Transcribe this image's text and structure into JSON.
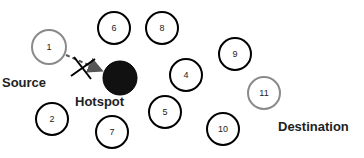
{
  "diagram": {
    "labels": {
      "source": "Source",
      "hotspot": "Hotspot",
      "destination": "Destination"
    },
    "colors": {
      "normal_stroke": "#000000",
      "endpoint_stroke": "#8a8a8a",
      "hotspot_fill": "#111111",
      "arrow": "#555555"
    },
    "nodes": [
      {
        "id": "1",
        "label": "1",
        "x": 49,
        "y": 47,
        "r": 18,
        "type": "source"
      },
      {
        "id": "2",
        "label": "2",
        "x": 52,
        "y": 119,
        "r": 16,
        "type": "normal"
      },
      {
        "id": "4",
        "label": "4",
        "x": 186,
        "y": 75,
        "r": 16,
        "type": "normal"
      },
      {
        "id": "5",
        "label": "5",
        "x": 165,
        "y": 112,
        "r": 16,
        "type": "normal"
      },
      {
        "id": "6",
        "label": "6",
        "x": 114,
        "y": 28,
        "r": 16,
        "type": "normal"
      },
      {
        "id": "7",
        "label": "7",
        "x": 112,
        "y": 132,
        "r": 16,
        "type": "normal"
      },
      {
        "id": "8",
        "label": "8",
        "x": 162,
        "y": 28,
        "r": 16,
        "type": "normal"
      },
      {
        "id": "9",
        "label": "9",
        "x": 235,
        "y": 54,
        "r": 16,
        "type": "normal"
      },
      {
        "id": "10",
        "label": "10",
        "x": 223,
        "y": 129,
        "r": 16,
        "type": "normal"
      },
      {
        "id": "11",
        "label": "11",
        "x": 264,
        "y": 93,
        "r": 16,
        "type": "destination"
      },
      {
        "id": "hotspot",
        "label": "",
        "x": 120,
        "y": 78,
        "r": 17,
        "type": "hotspot"
      }
    ],
    "edges": [
      {
        "from": "1",
        "to": "hotspot",
        "style": "dashed-arrow",
        "blocked": true
      }
    ]
  }
}
